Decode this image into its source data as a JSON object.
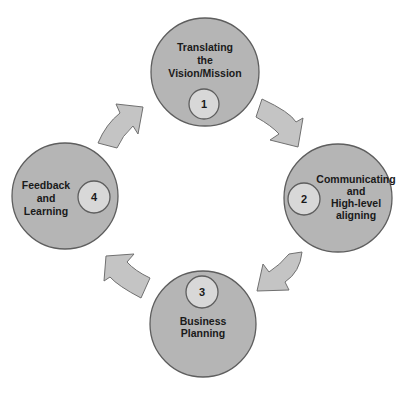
{
  "diagram": {
    "type": "cycle",
    "colors": {
      "outer_fill": "#b5b5b5",
      "inner_fill": "#d8d8d8",
      "arrow_fill": "#c4c4c4",
      "outline": "#5e5e5e"
    },
    "steps": [
      {
        "number": "1",
        "lines": [
          "Translating",
          "the",
          "Vision/Mission"
        ]
      },
      {
        "number": "2",
        "lines": [
          "Communicating",
          "and",
          "High-level",
          "aligning"
        ]
      },
      {
        "number": "3",
        "lines": [
          "Business",
          "Planning"
        ]
      },
      {
        "number": "4",
        "lines": [
          "Feedback",
          "and",
          "Learning"
        ]
      }
    ],
    "arrows": [
      {
        "from": "1",
        "to": "2",
        "direction": "clockwise"
      },
      {
        "from": "2",
        "to": "3",
        "direction": "clockwise"
      },
      {
        "from": "3",
        "to": "4",
        "direction": "clockwise"
      },
      {
        "from": "4",
        "to": "1",
        "direction": "clockwise"
      }
    ]
  }
}
